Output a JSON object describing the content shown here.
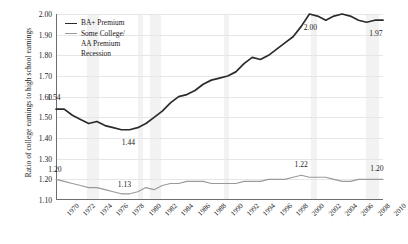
{
  "chart_data": {
    "type": "line",
    "title": "",
    "xlabel": "",
    "ylabel": "Ratio of college earnings to high school earnings",
    "ylim": [
      1.1,
      2.0
    ],
    "ytick_labels": [
      "2.00",
      "1.90",
      "1.80",
      "1.70",
      "1.60",
      "1.50",
      "1.40",
      "1.30",
      "1.20",
      "1.10"
    ],
    "ytick_values": [
      2.0,
      1.9,
      1.8,
      1.7,
      1.6,
      1.5,
      1.4,
      1.3,
      1.2,
      1.1
    ],
    "grid": true,
    "legend_position": "top-left",
    "xlim": [
      1970,
      2010
    ],
    "x": [
      1970,
      1971,
      1972,
      1973,
      1974,
      1975,
      1976,
      1977,
      1978,
      1979,
      1980,
      1981,
      1982,
      1983,
      1984,
      1985,
      1986,
      1987,
      1988,
      1989,
      1990,
      1991,
      1992,
      1993,
      1994,
      1995,
      1996,
      1997,
      1998,
      1999,
      2000,
      2001,
      2002,
      2003,
      2004,
      2005,
      2006,
      2007,
      2008,
      2009,
      2010
    ],
    "xtick_labels": [
      "1970",
      "1972",
      "1974",
      "1976",
      "1978",
      "1980",
      "1982",
      "1984",
      "1986",
      "1988",
      "1990",
      "1992",
      "1994",
      "1996",
      "1998",
      "2000",
      "2002",
      "2004",
      "2006",
      "2008",
      "2010"
    ],
    "series": [
      {
        "name": "BA+ Premium",
        "color": "#2b2b2b",
        "values": [
          1.54,
          1.54,
          1.51,
          1.49,
          1.47,
          1.48,
          1.46,
          1.45,
          1.44,
          1.44,
          1.45,
          1.47,
          1.5,
          1.53,
          1.57,
          1.6,
          1.61,
          1.63,
          1.66,
          1.68,
          1.69,
          1.7,
          1.72,
          1.76,
          1.79,
          1.78,
          1.8,
          1.83,
          1.86,
          1.89,
          1.94,
          2.0,
          1.99,
          1.97,
          1.99,
          2.0,
          1.99,
          1.97,
          1.96,
          1.97,
          1.97
        ]
      },
      {
        "name": "Some College/ AA Premium",
        "color": "#9a9a9a",
        "values": [
          1.2,
          1.19,
          1.18,
          1.17,
          1.16,
          1.16,
          1.15,
          1.14,
          1.13,
          1.13,
          1.14,
          1.16,
          1.15,
          1.17,
          1.18,
          1.18,
          1.19,
          1.19,
          1.19,
          1.18,
          1.18,
          1.18,
          1.18,
          1.19,
          1.19,
          1.19,
          1.2,
          1.2,
          1.2,
          1.21,
          1.22,
          1.21,
          1.21,
          1.21,
          1.2,
          1.19,
          1.19,
          1.2,
          1.2,
          1.2,
          1.2
        ]
      }
    ],
    "point_labels": [
      {
        "series": "BA+ Premium",
        "x": 1970,
        "value": "1.54",
        "dx": -2,
        "dy": -12
      },
      {
        "series": "BA+ Premium",
        "x": 1978,
        "value": "1.44",
        "dx": 7,
        "dy": 12
      },
      {
        "series": "BA+ Premium",
        "x": 2001,
        "value": "2.00",
        "dx": 1,
        "dy": 13
      },
      {
        "series": "BA+ Premium",
        "x": 2010,
        "value": "1.97",
        "dx": -7,
        "dy": 13
      },
      {
        "series": "Some College/ AA Premium",
        "x": 1970,
        "value": "1.20",
        "dx": -1,
        "dy": -10
      },
      {
        "series": "Some College/ AA Premium",
        "x": 1978,
        "value": "1.13",
        "dx": 3,
        "dy": -10
      },
      {
        "series": "Some College/ AA Premium",
        "x": 2000,
        "value": "1.22",
        "dx": 0,
        "dy": -11
      },
      {
        "series": "Some College/ AA Premium",
        "x": 2010,
        "value": "1.20",
        "dx": -6,
        "dy": -11
      }
    ],
    "recession_bands": [
      {
        "start": 1973.8,
        "end": 1975.2
      },
      {
        "start": 1980.0,
        "end": 1980.6
      },
      {
        "start": 1981.5,
        "end": 1982.9
      },
      {
        "start": 1990.5,
        "end": 1991.2
      },
      {
        "start": 2001.2,
        "end": 2001.9
      },
      {
        "start": 2007.9,
        "end": 2009.5
      }
    ],
    "recession_band_color": "#f2f2f2"
  },
  "legend": {
    "items": [
      {
        "label": "BA+ Premium",
        "swatch": "line-dark"
      },
      {
        "label": "Some College/",
        "swatch": "line-gray"
      },
      {
        "label": "AA Premium",
        "swatch": "none"
      },
      {
        "label": "Recession",
        "swatch": "none"
      }
    ]
  }
}
